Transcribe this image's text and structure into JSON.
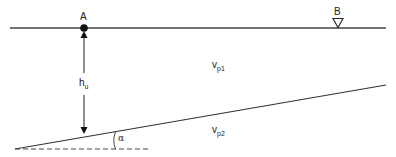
{
  "diagram": {
    "type": "seismic refraction sketch (dipping interface)",
    "points": {
      "A": {
        "label": "A",
        "marker": "filled-circle"
      },
      "B": {
        "label": "B",
        "marker": "inverted-triangle"
      }
    },
    "layers": {
      "upper": {
        "symbol": "v",
        "subscript": "p1"
      },
      "lower": {
        "symbol": "v",
        "subscript": "p2"
      }
    },
    "depth": {
      "symbol": "h",
      "subscript": "u"
    },
    "angle": {
      "symbol": "α"
    },
    "colors": {
      "line": "#333333",
      "text": "#222222",
      "background": "#ffffff"
    }
  }
}
